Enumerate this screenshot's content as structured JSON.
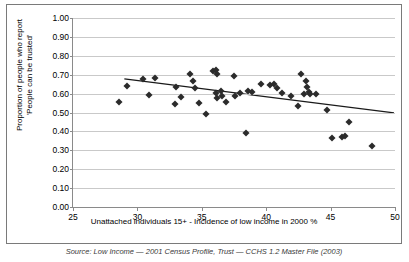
{
  "chart_data": {
    "type": "scatter",
    "title": "",
    "xlabel": "Unattached individuals 15+ - Incidence of low income in 2000 %",
    "ylabel": "Proportion of people who report\n'People can be trusted'",
    "xlim": [
      25,
      50
    ],
    "ylim": [
      0.0,
      1.0
    ],
    "xticks": [
      25,
      30,
      35,
      40,
      45,
      50
    ],
    "yticks": [
      "0.00",
      "0.10",
      "0.20",
      "0.30",
      "0.40",
      "0.50",
      "0.60",
      "0.70",
      "0.80",
      "0.90",
      "1.00"
    ],
    "grid": "horizontal",
    "legend": "none",
    "marker": "diamond",
    "marker_color": "#2b2b2b",
    "points": [
      {
        "x": 28.6,
        "y": 0.557
      },
      {
        "x": 29.2,
        "y": 0.641
      },
      {
        "x": 30.4,
        "y": 0.679
      },
      {
        "x": 30.9,
        "y": 0.595
      },
      {
        "x": 31.4,
        "y": 0.683
      },
      {
        "x": 32.9,
        "y": 0.545
      },
      {
        "x": 33.0,
        "y": 0.635
      },
      {
        "x": 33.4,
        "y": 0.583
      },
      {
        "x": 34.1,
        "y": 0.706
      },
      {
        "x": 34.3,
        "y": 0.666
      },
      {
        "x": 34.5,
        "y": 0.627
      },
      {
        "x": 34.8,
        "y": 0.552
      },
      {
        "x": 35.3,
        "y": 0.494
      },
      {
        "x": 35.9,
        "y": 0.722
      },
      {
        "x": 36.1,
        "y": 0.727
      },
      {
        "x": 36.1,
        "y": 0.604
      },
      {
        "x": 36.2,
        "y": 0.703
      },
      {
        "x": 36.2,
        "y": 0.577
      },
      {
        "x": 36.5,
        "y": 0.612
      },
      {
        "x": 36.6,
        "y": 0.589
      },
      {
        "x": 36.9,
        "y": 0.556
      },
      {
        "x": 37.5,
        "y": 0.691
      },
      {
        "x": 37.6,
        "y": 0.588
      },
      {
        "x": 38.0,
        "y": 0.604
      },
      {
        "x": 38.4,
        "y": 0.391
      },
      {
        "x": 38.6,
        "y": 0.613
      },
      {
        "x": 38.9,
        "y": 0.61
      },
      {
        "x": 39.6,
        "y": 0.651
      },
      {
        "x": 40.3,
        "y": 0.643
      },
      {
        "x": 40.6,
        "y": 0.649
      },
      {
        "x": 40.8,
        "y": 0.627
      },
      {
        "x": 41.2,
        "y": 0.602
      },
      {
        "x": 41.9,
        "y": 0.585
      },
      {
        "x": 42.5,
        "y": 0.533
      },
      {
        "x": 42.7,
        "y": 0.705
      },
      {
        "x": 42.9,
        "y": 0.597
      },
      {
        "x": 43.1,
        "y": 0.666
      },
      {
        "x": 43.2,
        "y": 0.633
      },
      {
        "x": 43.3,
        "y": 0.611
      },
      {
        "x": 43.4,
        "y": 0.598
      },
      {
        "x": 43.9,
        "y": 0.599
      },
      {
        "x": 44.7,
        "y": 0.513
      },
      {
        "x": 45.1,
        "y": 0.366
      },
      {
        "x": 45.9,
        "y": 0.373
      },
      {
        "x": 46.1,
        "y": 0.374
      },
      {
        "x": 46.4,
        "y": 0.45
      },
      {
        "x": 48.2,
        "y": 0.324
      }
    ],
    "trendline": {
      "type": "linear",
      "x0": 29.0,
      "y0": 0.676,
      "x1": 50.0,
      "y1": 0.495,
      "color": "#1a1a1a"
    }
  },
  "caption": {
    "source": "Source: Low Income — 2001 Census Profile, Trust — CCHS 1.2 Master File (2003)"
  }
}
